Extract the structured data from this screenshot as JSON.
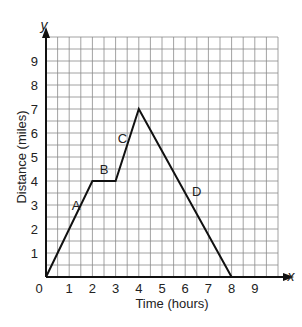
{
  "chart_data": {
    "type": "line",
    "title": "",
    "xlabel": "Time (hours)",
    "ylabel": "Distance (miles)",
    "x_axis_letter": "x",
    "y_axis_letter": "y",
    "origin_label": "0",
    "xlim": [
      0,
      10
    ],
    "ylim": [
      0,
      10
    ],
    "x_ticks": [
      "1",
      "2",
      "3",
      "4",
      "5",
      "6",
      "7",
      "8",
      "9"
    ],
    "y_ticks": [
      "1",
      "2",
      "3",
      "4",
      "5",
      "6",
      "7",
      "8",
      "9"
    ],
    "grid": true,
    "grid_step": 0.5,
    "series": [
      {
        "name": "trip",
        "points": [
          [
            0,
            0
          ],
          [
            2,
            4
          ],
          [
            3,
            4
          ],
          [
            4,
            7
          ],
          [
            8,
            0
          ]
        ]
      }
    ],
    "segment_labels": [
      {
        "text": "A",
        "x": 1.3,
        "y": 3.0
      },
      {
        "text": "B",
        "x": 2.5,
        "y": 4.5
      },
      {
        "text": "C",
        "x": 3.3,
        "y": 5.8
      },
      {
        "text": "D",
        "x": 6.5,
        "y": 3.6
      }
    ],
    "colors": {
      "line": "#111111",
      "grid": "#8a8a8a",
      "axis": "#111111"
    }
  }
}
